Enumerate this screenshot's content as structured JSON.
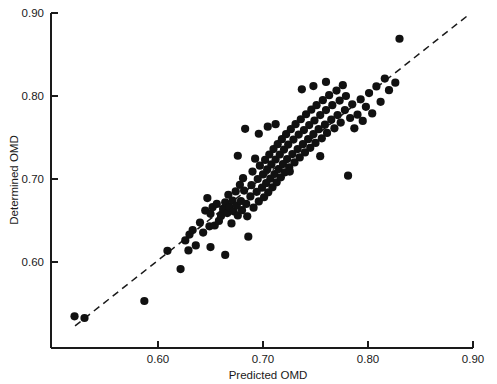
{
  "chart_data": {
    "type": "scatter",
    "title": "",
    "subtitle": "",
    "xlabel": "Predicted OMD",
    "ylabel": "Determined OMD",
    "xlim": [
      0.515,
      0.9
    ],
    "ylim": [
      0.528,
      0.9
    ],
    "xticks": [
      0.6,
      0.7,
      0.8,
      0.9
    ],
    "yticks": [
      0.6,
      0.7,
      0.8,
      0.9
    ],
    "xticklabels": [
      "0.60",
      "0.70",
      "0.80",
      "0.90"
    ],
    "yticklabels": [
      "0.60",
      "0.70",
      "0.80",
      "0.90"
    ],
    "grid": false,
    "legend": null,
    "annotations": [],
    "reference_line": {
      "style": "dashed",
      "description": "1:1 identity line",
      "x": [
        0.521,
        0.895
      ],
      "y": [
        0.523,
        0.897
      ]
    },
    "series": [
      {
        "name": "Samples",
        "marker": "filled-circle",
        "color": "#111111",
        "points": [
          [
            0.5205,
            0.5345
          ],
          [
            0.53,
            0.5325
          ],
          [
            0.587,
            0.553
          ],
          [
            0.609,
            0.6135
          ],
          [
            0.6215,
            0.5915
          ],
          [
            0.626,
            0.626
          ],
          [
            0.63,
            0.633
          ],
          [
            0.633,
            0.6385
          ],
          [
            0.636,
            0.62
          ],
          [
            0.64,
            0.6475
          ],
          [
            0.643,
            0.6355
          ],
          [
            0.645,
            0.662
          ],
          [
            0.647,
            0.677
          ],
          [
            0.649,
            0.643
          ],
          [
            0.65,
            0.658
          ],
          [
            0.652,
            0.666
          ],
          [
            0.654,
            0.644
          ],
          [
            0.656,
            0.67
          ],
          [
            0.658,
            0.6495
          ],
          [
            0.66,
            0.6555
          ],
          [
            0.662,
            0.664
          ],
          [
            0.664,
            0.672
          ],
          [
            0.666,
            0.659
          ],
          [
            0.667,
            0.681
          ],
          [
            0.668,
            0.666
          ],
          [
            0.67,
            0.6465
          ],
          [
            0.671,
            0.674
          ],
          [
            0.672,
            0.661
          ],
          [
            0.674,
            0.685
          ],
          [
            0.675,
            0.668
          ],
          [
            0.676,
            0.656
          ],
          [
            0.678,
            0.693
          ],
          [
            0.679,
            0.6735
          ],
          [
            0.68,
            0.6625
          ],
          [
            0.681,
            0.701
          ],
          [
            0.682,
            0.686
          ],
          [
            0.684,
            0.67
          ],
          [
            0.685,
            0.655
          ],
          [
            0.686,
            0.6305
          ],
          [
            0.688,
            0.679
          ],
          [
            0.689,
            0.6925
          ],
          [
            0.69,
            0.709
          ],
          [
            0.691,
            0.6655
          ],
          [
            0.6925,
            0.7245
          ],
          [
            0.694,
            0.6845
          ],
          [
            0.695,
            0.7
          ],
          [
            0.696,
            0.673
          ],
          [
            0.697,
            0.716
          ],
          [
            0.699,
            0.6895
          ],
          [
            0.7,
            0.7055
          ],
          [
            0.701,
            0.678
          ],
          [
            0.702,
            0.723
          ],
          [
            0.703,
            0.695
          ],
          [
            0.704,
            0.7115
          ],
          [
            0.705,
            0.684
          ],
          [
            0.706,
            0.7295
          ],
          [
            0.707,
            0.7005
          ],
          [
            0.708,
            0.7175
          ],
          [
            0.709,
            0.69
          ],
          [
            0.71,
            0.736
          ],
          [
            0.711,
            0.706
          ],
          [
            0.712,
            0.7235
          ],
          [
            0.713,
            0.696
          ],
          [
            0.714,
            0.742
          ],
          [
            0.715,
            0.712
          ],
          [
            0.716,
            0.7295
          ],
          [
            0.717,
            0.702
          ],
          [
            0.718,
            0.748
          ],
          [
            0.719,
            0.718
          ],
          [
            0.72,
            0.7355
          ],
          [
            0.721,
            0.708
          ],
          [
            0.722,
            0.754
          ],
          [
            0.723,
            0.724
          ],
          [
            0.724,
            0.7415
          ],
          [
            0.725,
            0.714
          ],
          [
            0.7265,
            0.76
          ],
          [
            0.728,
            0.73
          ],
          [
            0.729,
            0.7475
          ],
          [
            0.73,
            0.72
          ],
          [
            0.731,
            0.766
          ],
          [
            0.733,
            0.736
          ],
          [
            0.734,
            0.7535
          ],
          [
            0.735,
            0.726
          ],
          [
            0.736,
            0.772
          ],
          [
            0.738,
            0.742
          ],
          [
            0.739,
            0.759
          ],
          [
            0.74,
            0.732
          ],
          [
            0.741,
            0.778
          ],
          [
            0.743,
            0.748
          ],
          [
            0.744,
            0.765
          ],
          [
            0.745,
            0.7375
          ],
          [
            0.746,
            0.7835
          ],
          [
            0.748,
            0.754
          ],
          [
            0.749,
            0.7705
          ],
          [
            0.75,
            0.7435
          ],
          [
            0.751,
            0.789
          ],
          [
            0.753,
            0.76
          ],
          [
            0.7545,
            0.777
          ],
          [
            0.756,
            0.749
          ],
          [
            0.757,
            0.795
          ],
          [
            0.759,
            0.7655
          ],
          [
            0.76,
            0.783
          ],
          [
            0.761,
            0.7555
          ],
          [
            0.763,
            0.801
          ],
          [
            0.765,
            0.7715
          ],
          [
            0.766,
            0.789
          ],
          [
            0.768,
            0.761
          ],
          [
            0.77,
            0.8065
          ],
          [
            0.771,
            0.777
          ],
          [
            0.773,
            0.7945
          ],
          [
            0.774,
            0.768
          ],
          [
            0.776,
            0.813
          ],
          [
            0.778,
            0.783
          ],
          [
            0.779,
            0.8
          ],
          [
            0.781,
            0.704
          ],
          [
            0.783,
            0.7735
          ],
          [
            0.785,
            0.79
          ],
          [
            0.787,
            0.761
          ],
          [
            0.79,
            0.7775
          ],
          [
            0.793,
            0.796
          ],
          [
            0.795,
            0.77
          ],
          [
            0.798,
            0.787
          ],
          [
            0.801,
            0.8035
          ],
          [
            0.804,
            0.779
          ],
          [
            0.808,
            0.8115
          ],
          [
            0.812,
            0.793
          ],
          [
            0.816,
            0.821
          ],
          [
            0.82,
            0.807
          ],
          [
            0.826,
            0.816
          ],
          [
            0.83,
            0.869
          ],
          [
            0.683,
            0.7605
          ],
          [
            0.7045,
            0.763
          ],
          [
            0.7255,
            0.709
          ],
          [
            0.7545,
            0.7275
          ],
          [
            0.664,
            0.6085
          ],
          [
            0.65,
            0.618
          ],
          [
            0.629,
            0.614
          ],
          [
            0.712,
            0.766
          ],
          [
            0.737,
            0.808
          ],
          [
            0.748,
            0.812
          ],
          [
            0.76,
            0.817
          ],
          [
            0.696,
            0.7545
          ],
          [
            0.676,
            0.728
          ]
        ]
      }
    ]
  },
  "axes": {
    "x_label": "Predicted OMD",
    "y_label": "Determined OMD",
    "x_tick_labels": [
      "0.60",
      "0.70",
      "0.80",
      "0.90"
    ],
    "y_tick_labels": [
      "0.60",
      "0.70",
      "0.80",
      "0.90"
    ]
  }
}
